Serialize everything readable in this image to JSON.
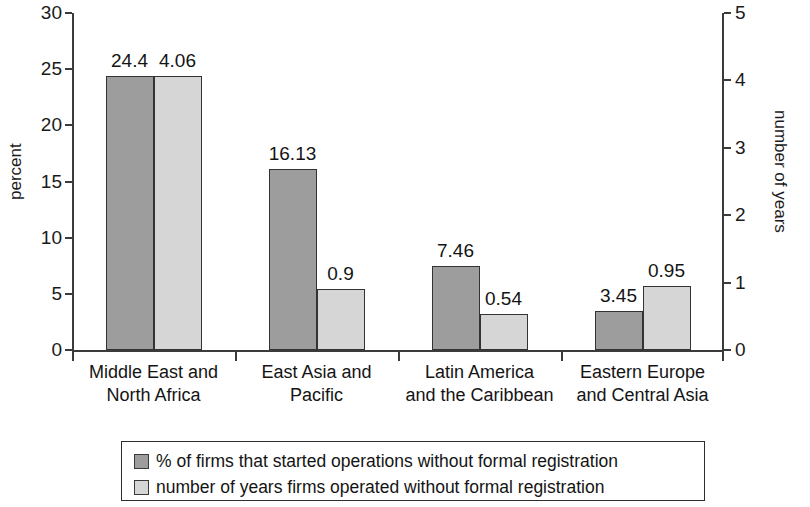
{
  "chart_data": {
    "type": "bar",
    "title": "",
    "categories": [
      "Middle East and\nNorth Africa",
      "East Asia and\nPacific",
      "Latin America\nand the Caribbean",
      "Eastern Europe\nand Central Asia"
    ],
    "series": [
      {
        "name": "% of firms that started operations without formal registration",
        "axis": "left",
        "color": "#9d9d9d",
        "values": [
          24.4,
          16.13,
          7.46,
          3.45
        ],
        "labels": [
          "24.4",
          "16.13",
          "7.46",
          "3.45"
        ]
      },
      {
        "name": "number of years firms operated without formal registration",
        "axis": "right",
        "color": "#d6d6d6",
        "values": [
          4.06,
          0.9,
          0.54,
          0.95
        ],
        "labels": [
          "4.06",
          "0.9",
          "0.54",
          "0.95"
        ]
      }
    ],
    "left_axis": {
      "label": "percent",
      "ylim": [
        0,
        30
      ],
      "ticks": [
        0,
        5,
        10,
        15,
        20,
        25,
        30
      ],
      "tick_labels": [
        "0",
        "5",
        "10",
        "15",
        "20",
        "25",
        "30"
      ]
    },
    "right_axis": {
      "label": "number of years",
      "ylim": [
        0,
        5
      ],
      "ticks": [
        0,
        1,
        2,
        3,
        4,
        5
      ],
      "tick_labels": [
        "0",
        "1",
        "2",
        "3",
        "4",
        "5"
      ]
    },
    "xlabel": "",
    "grid": false,
    "legend_position": "bottom",
    "legend": [
      "% of firms that started operations without formal registration",
      "number of years firms operated without formal registration"
    ]
  }
}
